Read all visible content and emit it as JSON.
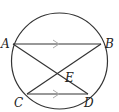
{
  "diagram": {
    "type": "circle-with-chords",
    "circle": {
      "cx": 59.5,
      "cy": 61,
      "r": 48
    },
    "points": {
      "A": {
        "label": "A",
        "x": 13,
        "y": 44
      },
      "B": {
        "label": "B",
        "x": 101,
        "y": 44
      },
      "C": {
        "label": "C",
        "x": 27,
        "y": 94
      },
      "D": {
        "label": "D",
        "x": 88,
        "y": 94
      },
      "E": {
        "label": "E",
        "x": 59,
        "y": 74
      }
    },
    "segments": [
      "AB",
      "CD",
      "AD",
      "BC"
    ],
    "parallel_marks": [
      "AB",
      "CD"
    ],
    "colors": {
      "stroke": "#333333",
      "arrow": "#aaaaaa",
      "label": "#222222"
    }
  }
}
